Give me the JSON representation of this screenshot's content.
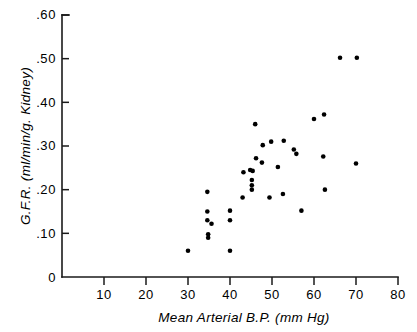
{
  "chart_data": {
    "type": "scatter",
    "title": "",
    "xlabel": "Mean  Arterial  B.P.  (mm Hg)",
    "ylabel": "G.F.R.  (ml/min/g. Kidney)",
    "xlim": [
      0,
      80
    ],
    "ylim": [
      0,
      0.6
    ],
    "grid": false,
    "legend": null,
    "xticks": [
      0,
      10,
      20,
      30,
      40,
      50,
      60,
      70,
      80
    ],
    "xtick_labels": [
      "",
      "10",
      "20",
      "30",
      "40",
      "50",
      "60",
      "70",
      "80"
    ],
    "yticks": [
      0,
      0.1,
      0.2,
      0.3,
      0.4,
      0.5,
      0.6
    ],
    "ytick_labels": [
      "0",
      ".10",
      ".20",
      ".30",
      ".40",
      ".50",
      ".60"
    ],
    "marker": "filled-circle",
    "marker_color": "#000000",
    "marker_size_px": 4.6,
    "points": [
      {
        "x": 30.0,
        "y": 0.06
      },
      {
        "x": 40.0,
        "y": 0.06
      },
      {
        "x": 34.6,
        "y": 0.195
      },
      {
        "x": 34.6,
        "y": 0.15
      },
      {
        "x": 34.6,
        "y": 0.13
      },
      {
        "x": 35.6,
        "y": 0.122
      },
      {
        "x": 34.8,
        "y": 0.098
      },
      {
        "x": 34.8,
        "y": 0.09
      },
      {
        "x": 40.0,
        "y": 0.152
      },
      {
        "x": 40.0,
        "y": 0.13
      },
      {
        "x": 43.2,
        "y": 0.24
      },
      {
        "x": 43.0,
        "y": 0.182
      },
      {
        "x": 44.8,
        "y": 0.245
      },
      {
        "x": 45.4,
        "y": 0.243
      },
      {
        "x": 45.2,
        "y": 0.222
      },
      {
        "x": 45.2,
        "y": 0.21
      },
      {
        "x": 45.2,
        "y": 0.2
      },
      {
        "x": 46.0,
        "y": 0.35
      },
      {
        "x": 46.2,
        "y": 0.272
      },
      {
        "x": 47.6,
        "y": 0.262
      },
      {
        "x": 47.8,
        "y": 0.302
      },
      {
        "x": 49.8,
        "y": 0.31
      },
      {
        "x": 49.4,
        "y": 0.182
      },
      {
        "x": 51.4,
        "y": 0.252
      },
      {
        "x": 52.8,
        "y": 0.312
      },
      {
        "x": 52.6,
        "y": 0.19
      },
      {
        "x": 55.2,
        "y": 0.292
      },
      {
        "x": 55.8,
        "y": 0.282
      },
      {
        "x": 57.0,
        "y": 0.152
      },
      {
        "x": 60.0,
        "y": 0.362
      },
      {
        "x": 62.4,
        "y": 0.372
      },
      {
        "x": 62.2,
        "y": 0.276
      },
      {
        "x": 62.6,
        "y": 0.2
      },
      {
        "x": 66.2,
        "y": 0.502
      },
      {
        "x": 70.2,
        "y": 0.502
      },
      {
        "x": 70.0,
        "y": 0.26
      }
    ]
  },
  "axes": {
    "y_axis_title": "G.F.R.  (ml/min/g. Kidney)",
    "x_axis_title": "Mean  Arterial  B.P.  (mm Hg)",
    "y_labels": [
      {
        "text": ".60",
        "value": 0.6
      },
      {
        "text": ".50",
        "value": 0.5
      },
      {
        "text": ".40",
        "value": 0.4
      },
      {
        "text": ".30",
        "value": 0.3
      },
      {
        "text": ".20",
        "value": 0.2
      },
      {
        "text": ".10",
        "value": 0.1
      },
      {
        "text": "0",
        "value": 0
      }
    ],
    "x_labels": [
      {
        "text": "10",
        "value": 10
      },
      {
        "text": "20",
        "value": 20
      },
      {
        "text": "30",
        "value": 30
      },
      {
        "text": "40",
        "value": 40
      },
      {
        "text": "50",
        "value": 50
      },
      {
        "text": "60",
        "value": 60
      },
      {
        "text": "70",
        "value": 70
      },
      {
        "text": "80",
        "value": 80
      }
    ]
  }
}
